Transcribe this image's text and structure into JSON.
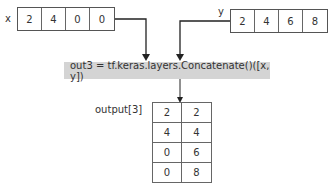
{
  "inputs": {
    "x": {
      "label": "x",
      "values": [
        "2",
        "4",
        "0",
        "0"
      ]
    },
    "y": {
      "label": "y",
      "values": [
        "2",
        "4",
        "6",
        "8"
      ]
    }
  },
  "operation": {
    "text": "out3 = tf.keras.layers.Concatenate()([x,  y])"
  },
  "output": {
    "label": "output[3]",
    "rows": [
      [
        "2",
        "2"
      ],
      [
        "4",
        "4"
      ],
      [
        "0",
        "6"
      ],
      [
        "0",
        "8"
      ]
    ]
  },
  "colors": {
    "op_background": "#d4d4d4",
    "line": "#333333"
  }
}
